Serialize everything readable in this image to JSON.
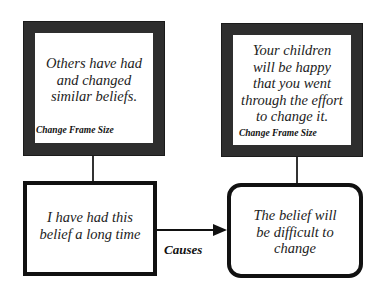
{
  "diagram": {
    "frames": [
      {
        "id": "left-frame",
        "lines": [
          "Others have had",
          "and changed",
          "similar beliefs."
        ],
        "caption": "Change Frame Size"
      },
      {
        "id": "right-frame",
        "lines": [
          "Your children",
          "will be happy",
          "that you went",
          "through the effort",
          "to change it."
        ],
        "caption": "Change Frame Size"
      }
    ],
    "boxes": [
      {
        "id": "belief-box",
        "lines": [
          "I have had this",
          "belief a long time"
        ],
        "shape": "rectangle"
      },
      {
        "id": "consequence-box",
        "lines": [
          "The belief will",
          "be difficult to",
          "change"
        ],
        "shape": "rounded-rectangle"
      }
    ],
    "arrow": {
      "from": "belief-box",
      "to": "consequence-box",
      "label": "Causes"
    },
    "colors": {
      "frame": "#2e2e2e",
      "line": "#111111",
      "background": "#ffffff"
    }
  }
}
